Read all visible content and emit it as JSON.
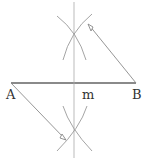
{
  "diagram": {
    "title": "",
    "labels": {
      "point_a": "A",
      "point_b": "B",
      "midpoint": "m"
    },
    "colors": {
      "segment": "#8a8a8a",
      "construction": "#9a9a9a",
      "text": "#333333"
    }
  }
}
